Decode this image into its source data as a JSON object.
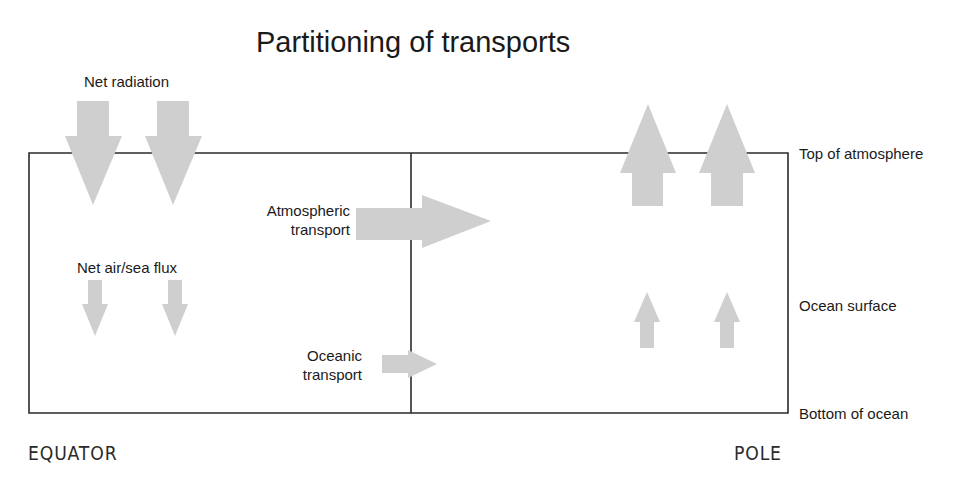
{
  "title": "Partitioning of transports",
  "labels": {
    "net_radiation": "Net radiation",
    "net_air_sea_flux": "Net air/sea flux",
    "atmospheric_transport_line1": "Atmospheric",
    "atmospheric_transport_line2": "transport",
    "oceanic_transport_line1": "Oceanic",
    "oceanic_transport_line2": "transport"
  },
  "levels": {
    "top_of_atmosphere": "Top of atmosphere",
    "ocean_surface": "Ocean surface",
    "bottom_of_ocean": "Bottom of ocean"
  },
  "axis": {
    "left": "EQUATOR",
    "right": "POLE"
  },
  "colors": {
    "arrow_fill": "#cfcfcf",
    "line": "#2a2a2a",
    "text": "#1a1a1a"
  },
  "arrows": [
    {
      "name": "net-radiation-arrow-1",
      "direction": "down",
      "region": "equator"
    },
    {
      "name": "net-radiation-arrow-2",
      "direction": "down",
      "region": "equator"
    },
    {
      "name": "net-air-sea-flux-arrow-1",
      "direction": "down",
      "region": "equator"
    },
    {
      "name": "net-air-sea-flux-arrow-2",
      "direction": "down",
      "region": "equator"
    },
    {
      "name": "atmospheric-transport-arrow",
      "direction": "right",
      "region": "middle"
    },
    {
      "name": "oceanic-transport-arrow",
      "direction": "right",
      "region": "middle"
    },
    {
      "name": "pole-radiation-arrow-1",
      "direction": "up",
      "region": "pole"
    },
    {
      "name": "pole-radiation-arrow-2",
      "direction": "up",
      "region": "pole"
    },
    {
      "name": "pole-ocean-flux-arrow-1",
      "direction": "up",
      "region": "pole"
    },
    {
      "name": "pole-ocean-flux-arrow-2",
      "direction": "up",
      "region": "pole"
    }
  ]
}
